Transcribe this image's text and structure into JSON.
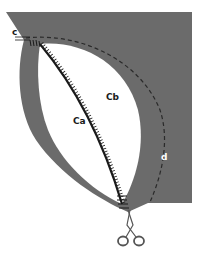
{
  "diagram": {
    "type": "sewing-illustration",
    "colors": {
      "fabric": "#6b6b6b",
      "background": "#ffffff",
      "seam": "#1a1a1a",
      "dashed_line": "#2a2a2a"
    },
    "labels": {
      "c": "c",
      "ca": "Ca",
      "cb": "Cb",
      "d": "d"
    },
    "icons": [
      "scissors-icon"
    ]
  }
}
